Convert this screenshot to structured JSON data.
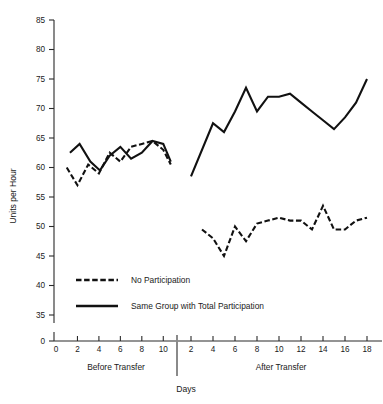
{
  "chart_data": {
    "type": "line",
    "title": "",
    "xlabel": "Days",
    "ylabel": "Units per Hour",
    "ylim": [
      35,
      85
    ],
    "y_axis_break_value": 0,
    "yticks": [
      85,
      80,
      75,
      70,
      65,
      60,
      55,
      50,
      45,
      40,
      35,
      0
    ],
    "grid": false,
    "legend_position": "inside-lower-left",
    "panels": [
      {
        "name": "Before Transfer",
        "label": "Before Transfer",
        "xticks": [
          0,
          2,
          4,
          6,
          8,
          10
        ],
        "xlim": [
          0,
          11
        ],
        "series": [
          {
            "name": "No Participation",
            "style": "dashed",
            "x": [
              1,
              2,
              3,
              4,
              5,
              6,
              7,
              8,
              9,
              10,
              10.7
            ],
            "values": [
              60.0,
              57.0,
              60.5,
              59.0,
              62.5,
              61.0,
              63.5,
              64.0,
              64.5,
              63.0,
              60.5
            ]
          },
          {
            "name": "Same Group with Total Participation",
            "style": "solid",
            "x": [
              1.3,
              2.2,
              3.2,
              4.1,
              5.0,
              6.0,
              7.0,
              8.0,
              9.0,
              10.0,
              10.7
            ],
            "values": [
              62.5,
              64.0,
              61.0,
              59.5,
              62.0,
              63.5,
              61.5,
              62.5,
              64.5,
              64.0,
              61.0
            ]
          }
        ]
      },
      {
        "name": "After Transfer",
        "label": "After Transfer",
        "xticks": [
          2,
          4,
          6,
          8,
          10,
          12,
          14,
          16,
          18
        ],
        "xlim": [
          1,
          19
        ],
        "series": [
          {
            "name": "No Participation",
            "style": "dashed",
            "x": [
              3,
              4,
              5,
              6,
              7,
              8,
              9,
              10,
              11,
              12,
              13,
              14,
              15,
              16,
              17,
              18
            ],
            "values": [
              49.5,
              48.0,
              45.0,
              50.0,
              47.5,
              50.5,
              51.0,
              51.5,
              51.0,
              51.0,
              49.5,
              53.5,
              49.5,
              49.5,
              51.0,
              51.5
            ]
          },
          {
            "name": "Same Group with Total Participation",
            "style": "solid",
            "x": [
              2,
              4,
              5,
              6,
              7,
              8,
              9,
              10,
              11,
              12,
              13,
              14,
              15,
              16,
              17,
              18
            ],
            "values": [
              58.5,
              67.5,
              66.0,
              69.5,
              73.5,
              69.5,
              72.0,
              72.0,
              72.5,
              71.0,
              69.5,
              68.0,
              66.5,
              68.5,
              71.0,
              75.0
            ]
          }
        ]
      }
    ],
    "legend": [
      {
        "label": "No Participation",
        "style": "dashed"
      },
      {
        "label": "Same Group with Total Participation",
        "style": "solid"
      }
    ]
  },
  "axis": {
    "y_title": "Units per Hour",
    "x_title": "Days",
    "ytick_labels": [
      "85",
      "80",
      "75",
      "70",
      "65",
      "60",
      "55",
      "50",
      "45",
      "40",
      "35",
      "0"
    ],
    "panel_before_xtick_labels": [
      "0",
      "2",
      "4",
      "6",
      "8",
      "10"
    ],
    "panel_after_xtick_labels": [
      "2",
      "4",
      "6",
      "8",
      "10",
      "12",
      "14",
      "16",
      "18"
    ],
    "panel_before_label": "Before Transfer",
    "panel_after_label": "After Transfer"
  },
  "legend": {
    "no_participation": "No Participation",
    "total_participation": "Same Group with Total Participation"
  },
  "colors": {
    "ink": "#111111",
    "axis": "#2a2a2a",
    "background": "#ffffff"
  }
}
